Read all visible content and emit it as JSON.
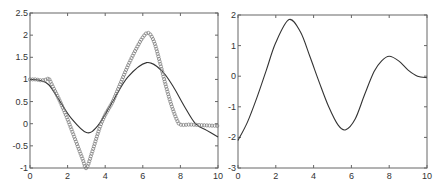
{
  "chart_data": [
    {
      "type": "line",
      "title": "",
      "xlabel": "",
      "ylabel": "",
      "xlim": [
        0,
        10
      ],
      "ylim": [
        -1,
        2.5
      ],
      "xticks": [
        "0",
        "2",
        "4",
        "6",
        "8",
        "10"
      ],
      "yticks": [
        "-1",
        "-0.5",
        "0",
        "0.5",
        "1",
        "1.5",
        "2",
        "2.5"
      ],
      "grid": false,
      "legend": null,
      "series": [
        {
          "name": "smooth curve",
          "style": "solid",
          "x": [
            0,
            0.5,
            1.0,
            1.6,
            2.2,
            3.0,
            3.6,
            4.4,
            5.2,
            6.2,
            7.0,
            7.6,
            8.2,
            8.8,
            9.4,
            10
          ],
          "y": [
            1.0,
            0.98,
            0.88,
            0.5,
            0.12,
            -0.2,
            -0.05,
            0.5,
            1.05,
            1.38,
            1.2,
            0.85,
            0.4,
            0.0,
            -0.15,
            -0.3
          ]
        },
        {
          "name": "circle markers",
          "style": "markers-o",
          "x": [
            0,
            0.3,
            0.6,
            0.9,
            1.0,
            1.2,
            1.6,
            2.0,
            2.4,
            2.8,
            3.0,
            3.3,
            3.7,
            4.0,
            4.4,
            4.8,
            5.2,
            5.6,
            6.0,
            6.3,
            6.6,
            6.9,
            7.2,
            7.5,
            7.8,
            8.0,
            8.5,
            9.0,
            9.5,
            10
          ],
          "y": [
            1.0,
            1.0,
            0.98,
            1.0,
            1.02,
            0.85,
            0.5,
            0.1,
            -0.35,
            -0.8,
            -1.0,
            -0.65,
            -0.1,
            0.2,
            0.5,
            0.9,
            1.3,
            1.65,
            1.95,
            2.05,
            1.85,
            1.4,
            0.9,
            0.45,
            0.1,
            -0.02,
            -0.02,
            -0.03,
            -0.04,
            -0.05
          ]
        }
      ]
    },
    {
      "type": "line",
      "title": "",
      "xlabel": "",
      "ylabel": "",
      "xlim": [
        0,
        10
      ],
      "ylim": [
        -3,
        2
      ],
      "xticks": [
        "0",
        "2",
        "4",
        "6",
        "8",
        "10"
      ],
      "yticks": [
        "-3",
        "-2",
        "-1",
        "0",
        "1",
        "2"
      ],
      "grid": false,
      "legend": null,
      "series": [
        {
          "name": "curve",
          "style": "solid",
          "x": [
            0,
            0.5,
            1.0,
            1.5,
            2.0,
            2.7,
            3.3,
            3.8,
            4.3,
            4.8,
            5.3,
            5.7,
            6.2,
            6.7,
            7.2,
            7.6,
            8.0,
            8.5,
            9.0,
            9.5,
            10
          ],
          "y": [
            -2.1,
            -1.5,
            -0.7,
            0.2,
            1.1,
            1.85,
            1.45,
            0.65,
            -0.2,
            -1.0,
            -1.6,
            -1.75,
            -1.4,
            -0.6,
            0.15,
            0.5,
            0.65,
            0.5,
            0.2,
            0.0,
            -0.05
          ]
        }
      ]
    }
  ]
}
